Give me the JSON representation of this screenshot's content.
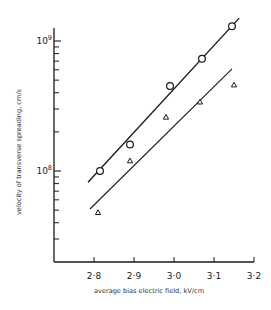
{
  "chart_data": {
    "type": "scatter",
    "title": "",
    "xlabel": "average bias electric field, kV/cm",
    "ylabel": "velocity of transverse spreading, cm/s",
    "xscale": "linear",
    "yscale": "log",
    "xlim": [
      2.715,
      3.2
    ],
    "ylim": [
      20000000.0,
      1260000000.0
    ],
    "grid": false,
    "legend": null,
    "x_ticks": [
      2.8,
      2.9,
      3.0,
      3.1,
      3.2
    ],
    "x_tick_labels": [
      "2·8",
      "2·9",
      "3·0",
      "3·1",
      "3·2"
    ],
    "y_major_ticks": [
      100000000.0,
      1000000000.0
    ],
    "y_major_tick_labels": [
      "10",
      "10"
    ],
    "y_major_tick_exponents": [
      "8",
      "9"
    ],
    "y_minor_ticks": [
      30000000.0,
      40000000.0,
      50000000.0,
      60000000.0,
      70000000.0,
      80000000.0,
      90000000.0,
      200000000.0,
      300000000.0,
      400000000.0,
      500000000.0,
      600000000.0,
      700000000.0,
      800000000.0,
      900000000.0
    ],
    "series": [
      {
        "name": "circles",
        "marker": "circle",
        "x": [
          2.815,
          2.89,
          2.99,
          3.07,
          3.145
        ],
        "y": [
          100000000.0,
          160000000.0,
          450000000.0,
          730000000.0,
          1300000000.0
        ],
        "fit_line": {
          "x": [
            2.785,
            3.163
          ],
          "y": [
            82000000.0,
            1500000000.0
          ]
        }
      },
      {
        "name": "triangles",
        "marker": "triangle",
        "x": [
          2.81,
          2.89,
          2.98,
          3.065,
          3.15
        ],
        "y": [
          48000000.0,
          120000000.0,
          260000000.0,
          340000000.0,
          460000000.0
        ],
        "fit_line": {
          "x": [
            2.79,
            3.145
          ],
          "y": [
            51000000.0,
            610000000.0
          ]
        }
      }
    ],
    "colors": {
      "ink": "#1a1a1a",
      "background": "#ffffff"
    }
  },
  "layout": {
    "plot": {
      "x0": 54,
      "y_top": 28,
      "y_bottom": 262,
      "x_right": 254
    },
    "x_map": {
      "v0": 2.8,
      "px0": 94,
      "px_per_unit": 400
    },
    "y_map": {
      "log0": 8,
      "px0": 171,
      "px_per_decade": 130
    }
  }
}
